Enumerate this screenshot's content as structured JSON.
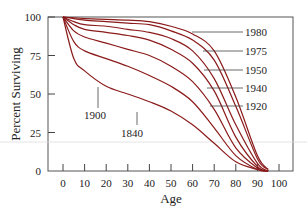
{
  "chart_data": {
    "type": "line",
    "title": "",
    "xlabel": "Age",
    "ylabel": "Percent Surviving",
    "xlim": [
      0,
      100
    ],
    "ylim": [
      0,
      100
    ],
    "x_ticks": [
      0,
      10,
      20,
      30,
      40,
      50,
      60,
      70,
      80,
      90,
      100
    ],
    "y_ticks": [
      0,
      25,
      50,
      75,
      100
    ],
    "grid": false,
    "legend": "inline labels with leader lines",
    "line_color": "#8b1a1a",
    "x": [
      0,
      5,
      10,
      20,
      30,
      40,
      50,
      60,
      70,
      80,
      90,
      95
    ],
    "series": [
      {
        "name": "1980",
        "values": [
          100,
          99.5,
          99,
          98.5,
          98,
          97,
          94,
          89,
          78,
          48,
          10,
          1
        ]
      },
      {
        "name": "1975",
        "values": [
          100,
          99,
          98,
          97,
          96,
          95,
          91,
          85,
          72,
          42,
          8,
          1
        ]
      },
      {
        "name": "1950",
        "values": [
          100,
          97,
          95,
          94,
          92,
          90,
          86,
          78,
          60,
          30,
          5,
          0
        ]
      },
      {
        "name": "1940",
        "values": [
          100,
          95,
          92,
          90,
          88,
          85,
          79,
          70,
          52,
          22,
          3,
          0
        ]
      },
      {
        "name": "1920",
        "values": [
          100,
          91,
          87,
          83,
          79,
          75,
          68,
          58,
          40,
          15,
          2,
          0
        ]
      },
      {
        "name": "1900",
        "values": [
          100,
          84,
          78,
          73,
          68,
          62,
          55,
          45,
          28,
          10,
          1,
          0
        ]
      },
      {
        "name": "1840",
        "values": [
          100,
          73,
          65,
          55,
          50,
          45,
          39,
          30,
          18,
          6,
          1,
          0
        ]
      }
    ]
  },
  "labels": {
    "y_title": "Percent Surviving",
    "x_title": "Age",
    "x_ticks": [
      "0",
      "10",
      "20",
      "30",
      "40",
      "50",
      "60",
      "70",
      "80",
      "90",
      "100"
    ],
    "y_ticks": [
      "0",
      "25",
      "50",
      "75",
      "100"
    ],
    "series": [
      "1980",
      "1975",
      "1950",
      "1940",
      "1920",
      "1900",
      "1840"
    ]
  }
}
